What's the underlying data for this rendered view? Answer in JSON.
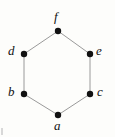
{
  "figure": {
    "name": "hexagon-graph",
    "background_color": "#fdfdfb",
    "width": 115,
    "height": 137
  },
  "chart_data": {
    "type": "diagram",
    "shape": "hexagon",
    "title": "",
    "vertex_color": "#111111",
    "edge_color": "#9a9a9a",
    "edge_width": 1,
    "vertex_radius": 3.2,
    "nodes": [
      {
        "id": "f",
        "label": "f",
        "x": 58,
        "y": 31,
        "label_x": 54,
        "label_y": 10
      },
      {
        "id": "d",
        "label": "d",
        "x": 24,
        "y": 54,
        "label_x": 8,
        "label_y": 44
      },
      {
        "id": "e",
        "label": "e",
        "x": 90,
        "y": 54,
        "label_x": 96,
        "label_y": 44
      },
      {
        "id": "b",
        "label": "b",
        "x": 24,
        "y": 94,
        "label_x": 8,
        "label_y": 85
      },
      {
        "id": "c",
        "label": "c",
        "x": 90,
        "y": 94,
        "label_x": 97,
        "label_y": 85
      },
      {
        "id": "a",
        "label": "a",
        "x": 58,
        "y": 115,
        "label_x": 54,
        "label_y": 119
      }
    ],
    "edges": [
      {
        "from": "f",
        "to": "d"
      },
      {
        "from": "f",
        "to": "e"
      },
      {
        "from": "d",
        "to": "b"
      },
      {
        "from": "e",
        "to": "c"
      },
      {
        "from": "b",
        "to": "a"
      },
      {
        "from": "c",
        "to": "a"
      }
    ]
  }
}
